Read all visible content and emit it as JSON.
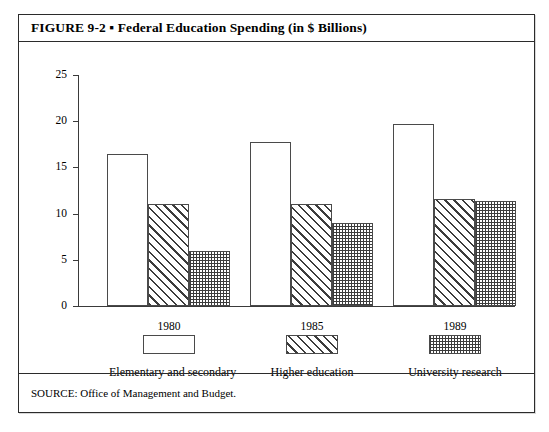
{
  "figure": {
    "title": "FIGURE 9-2 ▪ Federal Education Spending (in $ Billions)",
    "source": "SOURCE: Office of Management and Budget."
  },
  "chart_data": {
    "type": "bar",
    "title": "Federal Education Spending (in $ Billions)",
    "xlabel": "",
    "ylabel": "",
    "ylim": [
      0,
      25
    ],
    "yticks": [
      0,
      5,
      10,
      15,
      20,
      25
    ],
    "ytick_labels": [
      "0",
      "5",
      "10",
      "15",
      "20",
      "25"
    ],
    "grid": false,
    "legend_position": "below-axis",
    "categories": [
      "Elementary and secondary",
      "Higher education",
      "University research"
    ],
    "series": [
      {
        "name": "1980",
        "pattern": "solid-white",
        "values": [
          16.4,
          17.8,
          19.7
        ]
      },
      {
        "name": "1985",
        "pattern": "diagonal-hatch",
        "values": [
          11.0,
          11.0,
          11.6
        ]
      },
      {
        "name": "1989",
        "pattern": "dotted",
        "values": [
          6.0,
          9.0,
          11.4
        ]
      }
    ]
  }
}
